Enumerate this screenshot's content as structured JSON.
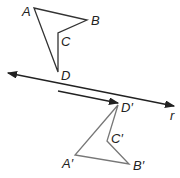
{
  "figure": {
    "labels": {
      "A": "A",
      "B": "B",
      "C": "C",
      "D": "D",
      "A_prime": "A′",
      "B_prime": "B′",
      "C_prime": "C′",
      "D_prime": "D′",
      "line": "r"
    },
    "colors": {
      "original_shape": "#333333",
      "image_shape": "#777777",
      "line": "#222222",
      "arrow": "#222222"
    }
  }
}
